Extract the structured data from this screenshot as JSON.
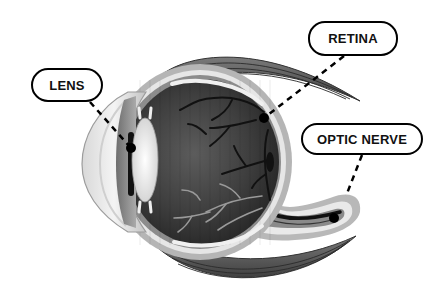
{
  "diagram": {
    "labels": [
      {
        "id": "lens",
        "text": "LENS",
        "box": [
          31,
          68,
          72,
          34
        ],
        "pointer_to": [
          131,
          148
        ]
      },
      {
        "id": "retina",
        "text": "RETINA",
        "box": [
          308,
          21,
          90,
          35
        ],
        "pointer_to": [
          264,
          118
        ]
      },
      {
        "id": "optic-nerve",
        "text": "OPTIC NERVE",
        "box": [
          301,
          123,
          122,
          32
        ],
        "pointer_to": [
          334,
          218
        ]
      }
    ],
    "colors": {
      "outline": "#000000",
      "sclera_outer": "#b5b5b5",
      "sclera_inner": "#e6e6e6",
      "choroid": "#8c8c8c",
      "vitreous_dark": "#2e2e2e",
      "vitreous_mid": "#6a6a6a",
      "lens": "#f0f0f0",
      "muscle": "#5a5a5a",
      "vessel_dark": "#111111",
      "vessel_light": "#9a9a9a"
    }
  }
}
